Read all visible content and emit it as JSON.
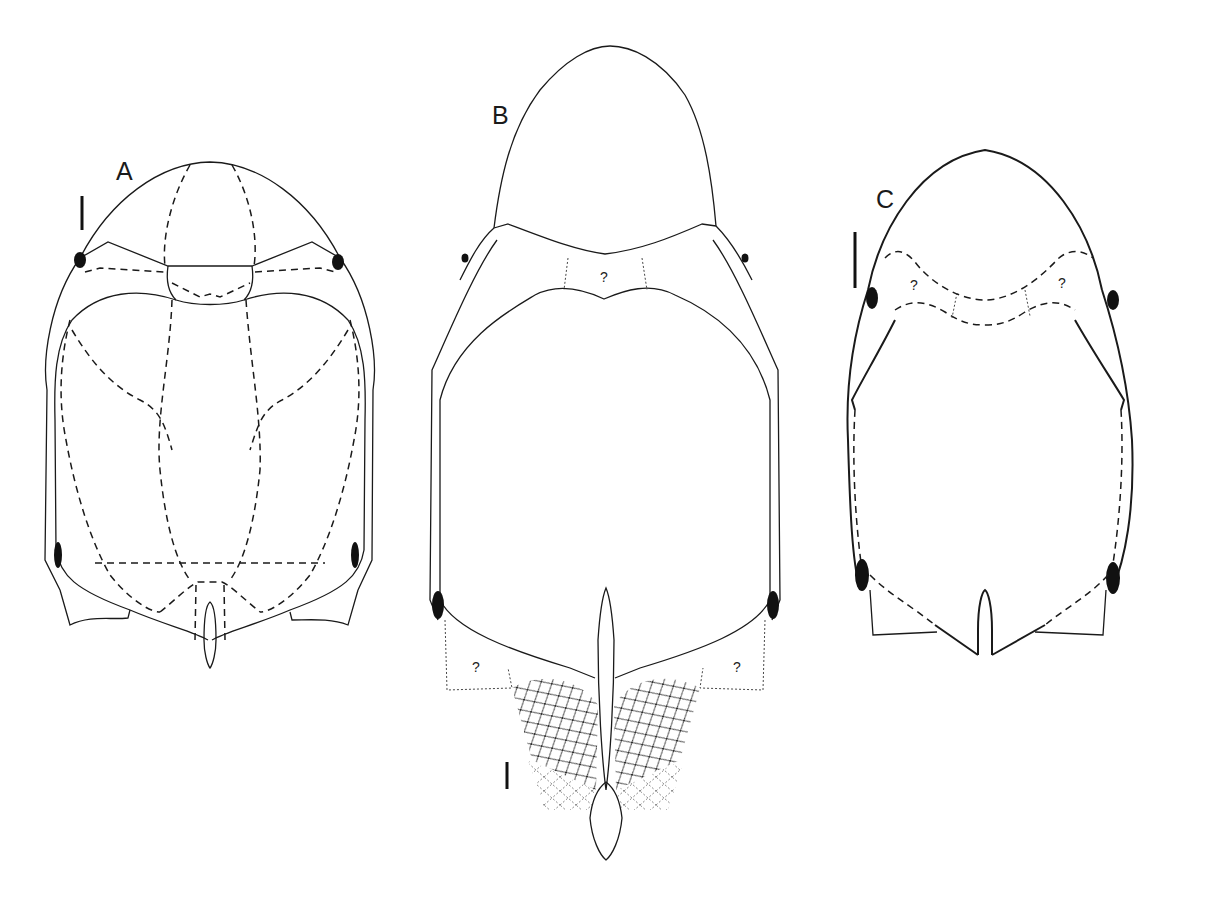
{
  "figure": {
    "panels": [
      {
        "id": "A",
        "label": "A",
        "uncertain_marks": []
      },
      {
        "id": "B",
        "label": "B",
        "uncertain_marks": [
          "?",
          "?",
          "?"
        ]
      },
      {
        "id": "C",
        "label": "C",
        "uncertain_marks": [
          "?",
          "?"
        ]
      }
    ],
    "colors": {
      "line": "#1a1a1a",
      "background": "#ffffff"
    }
  }
}
